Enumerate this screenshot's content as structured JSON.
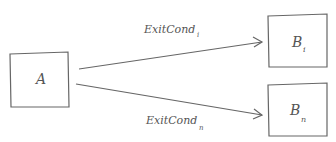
{
  "diagram": {
    "nodes": [
      {
        "id": "A",
        "label": "A",
        "sub": ""
      },
      {
        "id": "Bi",
        "label": "B",
        "sub": "i"
      },
      {
        "id": "Bn",
        "label": "B",
        "sub": "n"
      }
    ],
    "edges": [
      {
        "from": "A",
        "to": "Bi",
        "label": "ExitCond",
        "sub": "i"
      },
      {
        "from": "A",
        "to": "Bn",
        "label": "ExitCond",
        "sub": "n"
      }
    ],
    "colors": {
      "stroke": "#666666",
      "text": "#555555",
      "background": "#ffffff"
    }
  }
}
